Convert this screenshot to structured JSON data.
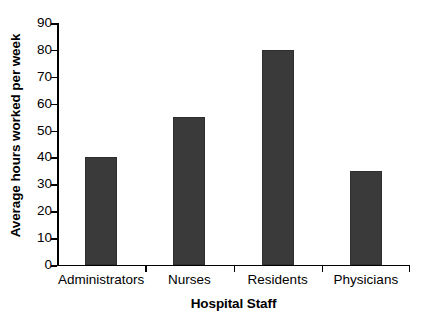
{
  "chart_data": {
    "type": "bar",
    "title": "",
    "subtitle": "",
    "categories": [
      "Administrators",
      "Nurses",
      "Residents",
      "Physicians"
    ],
    "values": [
      40,
      55,
      80,
      35
    ],
    "xlabel": "Hospital Staff",
    "ylabel": "Average hours worked per week",
    "ylim": [
      0,
      90
    ],
    "ytick_step": 10,
    "yticks": [
      0,
      10,
      20,
      30,
      40,
      50,
      60,
      70,
      80,
      90
    ],
    "ytick_labels": [
      "0",
      "10",
      "20",
      "30",
      "40",
      "50",
      "60",
      "70",
      "80",
      "90"
    ],
    "grid": false,
    "legend": null,
    "bar_color": "#3a3a3a",
    "axis_color": "#000000",
    "background_color": "#ffffff",
    "annotations": []
  }
}
